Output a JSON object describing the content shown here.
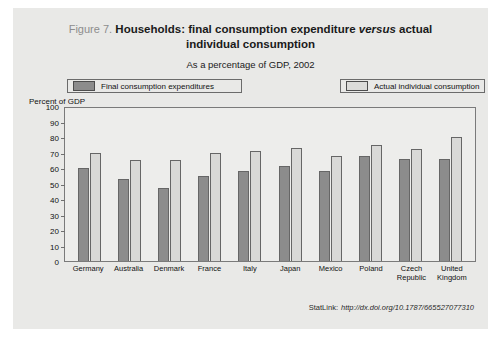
{
  "figure": {
    "number": "Figure 7.",
    "title": "Households: final consumption expenditure ",
    "title_em": "versus",
    "title_tail": " actual individual consumption",
    "subtitle": "As a percentage of GDP, 2002"
  },
  "legend": {
    "final_label": "Final consumption expenditures",
    "actual_label": "Actual individual consumption"
  },
  "axis": {
    "unit_label": "Percent of GDP"
  },
  "statlink": {
    "label": "StatLink:",
    "url": "http://dx.doi.org/10.1787/665527077310"
  },
  "colors": {
    "final_consumption": "#8c8c8c",
    "actual_consumption": "#d9d9d7",
    "page_background": "#e9e9e7",
    "plot_background": "#ededeb",
    "axis_line": "#7a7a7a"
  },
  "chart_data": {
    "type": "bar",
    "title": "Households: final consumption expenditure versus actual individual consumption",
    "subtitle": "As a percentage of GDP, 2002",
    "xlabel": "",
    "ylabel": "Percent of GDP",
    "ylim": [
      0,
      100
    ],
    "ytick_step": 10,
    "yticks": [
      0,
      10,
      20,
      30,
      40,
      50,
      60,
      70,
      80,
      90,
      100
    ],
    "grid": false,
    "legend_position": "top",
    "categories": [
      "Germany",
      "Australia",
      "Denmark",
      "France",
      "Italy",
      "Japan",
      "Mexico",
      "Poland",
      "Czech Republic",
      "United Kingdom"
    ],
    "series": [
      {
        "name": "Final consumption expenditures",
        "color": "#8c8c8c",
        "values": [
          60,
          53,
          47,
          55,
          58,
          61,
          58,
          68,
          66,
          66
        ]
      },
      {
        "name": "Actual individual consumption",
        "color": "#d9d9d7",
        "values": [
          70,
          65,
          65,
          70,
          71,
          73,
          68,
          75,
          72,
          80
        ]
      }
    ]
  }
}
